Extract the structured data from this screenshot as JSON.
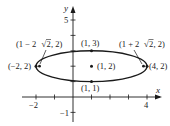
{
  "diagram": {
    "type": "ellipse-graph",
    "colors": {
      "stroke": "#1a1a1a",
      "background": "#ffffff"
    },
    "axes": {
      "x_label": "x",
      "y_label": "y",
      "x_ticks_labeled": [
        {
          "value": -2,
          "label": "−2"
        },
        {
          "value": 4,
          "label": "4"
        }
      ],
      "y_ticks_labeled": [
        {
          "value": 5,
          "label": "5"
        },
        {
          "value": -1,
          "label": "−1"
        }
      ],
      "x_tick_values": [
        -2,
        -1,
        1,
        2,
        3,
        4
      ],
      "y_tick_values": [
        -1,
        1,
        2,
        3,
        4,
        5
      ]
    },
    "ellipse": {
      "center": [
        1,
        2
      ],
      "semi_major": 3,
      "semi_minor": 1
    },
    "points": [
      {
        "name": "left-vertex",
        "coords": [
          -2,
          2
        ],
        "label": "(−2, 2)"
      },
      {
        "name": "right-vertex",
        "coords": [
          4,
          2
        ],
        "label": "(4, 2)"
      },
      {
        "name": "center",
        "coords": [
          1,
          2
        ],
        "label": "(1, 2)"
      },
      {
        "name": "top-covertex",
        "coords": [
          1,
          3
        ],
        "label": "(1, 3)"
      },
      {
        "name": "bottom-covertex",
        "coords": [
          1,
          1
        ],
        "label": "(1, 1)"
      },
      {
        "name": "left-focus",
        "label_prefix": "(1 − 2",
        "label_radicand": "2",
        "label_suffix": ", 2)"
      },
      {
        "name": "right-focus",
        "label_prefix": "(1 + 2",
        "label_radicand": "2",
        "label_suffix": ", 2)"
      }
    ]
  }
}
